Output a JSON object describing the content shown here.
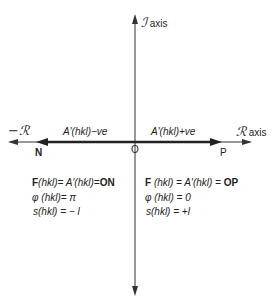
{
  "diagram": {
    "vertical_axis": {
      "symbol": "ℐ",
      "label": "axis"
    },
    "horizontal_axis": {
      "positive_symbol": "ℛ",
      "positive_label": "axis",
      "negative_label": "−ℛ"
    },
    "origin_label": "O",
    "point_negative": "N",
    "point_positive": "P",
    "segment_negative_label": "A′(hkl)−ve",
    "segment_positive_label": "A′(hkl)+ve",
    "left_equations": {
      "F": {
        "prefix": "F",
        "middle": "(hkl)=  A′(hkl)=",
        "suffix": "ON"
      },
      "phi": "φ (hkl)= π",
      "s": "s(hkl) = − l"
    },
    "right_equations": {
      "F": {
        "prefix": "F",
        "middle": " (hkl) = A′(hkl) = ",
        "suffix": "OP"
      },
      "phi": "φ (hkl) = 0",
      "s": "s(hkl) = +l"
    }
  }
}
